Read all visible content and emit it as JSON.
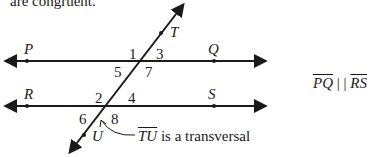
{
  "header_text": "are congruent.",
  "points": {
    "P": "P",
    "Q": "Q",
    "R": "R",
    "S": "S",
    "T": "T",
    "U": "U"
  },
  "angles": [
    "1",
    "2",
    "3",
    "4",
    "5",
    "6",
    "7",
    "8"
  ],
  "annotation": {
    "segment": "TU",
    "suffix": " is a transversal"
  },
  "relation": {
    "left": "PQ",
    "symbol": "| |",
    "right": "RS"
  },
  "colors": {
    "line": "#1a1a1a",
    "background": "#ffffff"
  }
}
